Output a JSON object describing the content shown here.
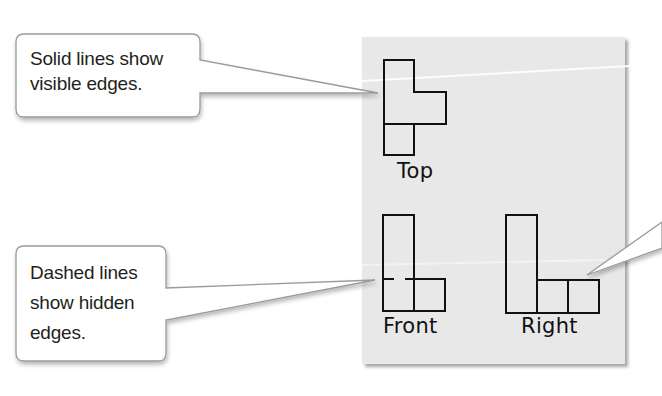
{
  "callouts": {
    "solid": {
      "line1": "Solid lines show",
      "line2": "visible edges."
    },
    "dashed": {
      "line1": "Dashed lines",
      "line2": "show hidden",
      "line3": "edges."
    }
  },
  "views": {
    "top": {
      "label": "Top"
    },
    "front": {
      "label": "Front"
    },
    "right": {
      "label": "Right"
    }
  },
  "colors": {
    "card_background": "#e8e8e8",
    "line": "#111111",
    "callout_border": "#9a9a9a"
  }
}
